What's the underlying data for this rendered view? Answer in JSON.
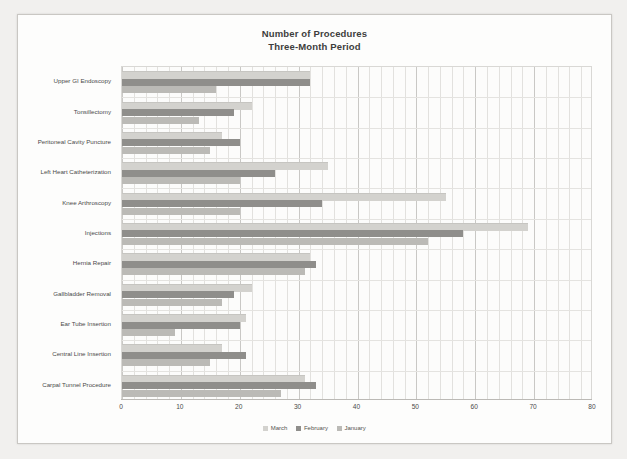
{
  "chart_data": {
    "type": "bar",
    "orientation": "horizontal",
    "title": "Number of Procedures",
    "subtitle": "Three-Month Period",
    "xlabel": "",
    "ylabel": "",
    "xlim": [
      0,
      80
    ],
    "xticks": [
      0,
      10,
      20,
      30,
      40,
      50,
      60,
      70,
      80
    ],
    "grid": true,
    "legend_position": "bottom",
    "categories": [
      "Upper GI Endoscopy",
      "Tonsillectomy",
      "Peritoneal Cavity Puncture",
      "Left Heart Catheterization",
      "Knee Arthroscopy",
      "Injections",
      "Hernia Repair",
      "Gallbladder Removal",
      "Ear Tube Insertion",
      "Central Line Insertion",
      "Carpal Tunnel Procedure"
    ],
    "series": [
      {
        "name": "March",
        "color": "#d3d2ce",
        "values": [
          32,
          22,
          17,
          35,
          55,
          69,
          32,
          22,
          21,
          17,
          31
        ]
      },
      {
        "name": "February",
        "color": "#8f8e8b",
        "values": [
          32,
          19,
          20,
          26,
          34,
          58,
          33,
          19,
          20,
          21,
          33
        ]
      },
      {
        "name": "January",
        "color": "#bbbab6",
        "values": [
          16,
          13,
          15,
          20,
          20,
          52,
          31,
          17,
          9,
          15,
          27
        ]
      }
    ]
  },
  "legend": [
    {
      "label": "March",
      "color": "#d3d2ce"
    },
    {
      "label": "February",
      "color": "#8f8e8b"
    },
    {
      "label": "January",
      "color": "#bbbab6"
    }
  ]
}
